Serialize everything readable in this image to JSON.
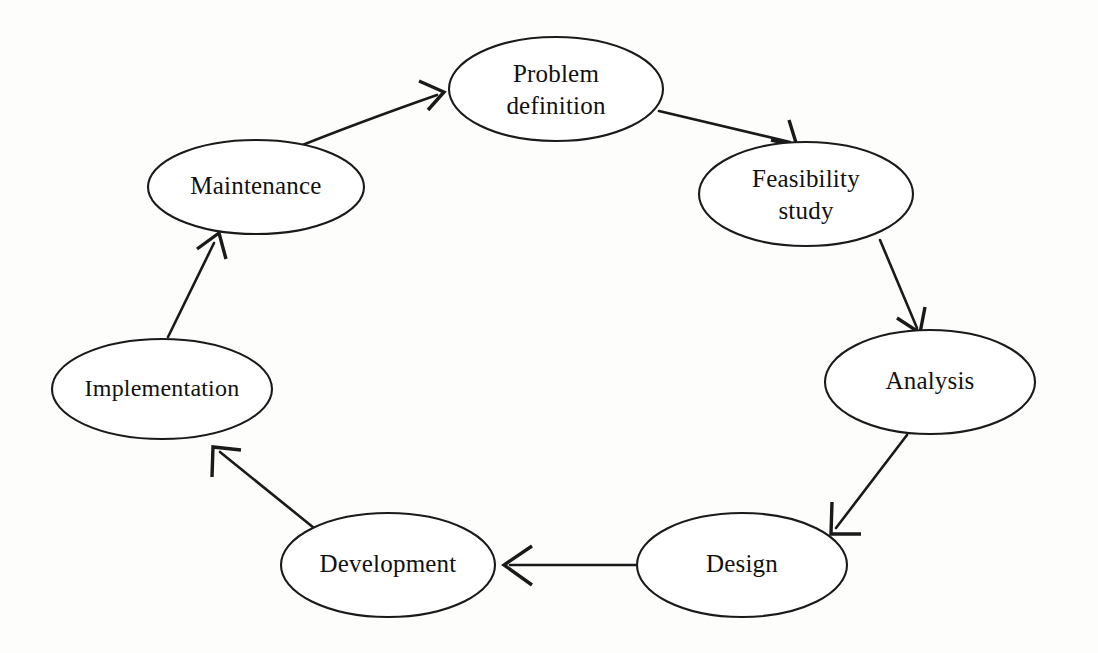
{
  "diagram": {
    "type": "cycle",
    "direction": "clockwise",
    "background_color": "#fdfdfc",
    "stroke_color": "#1a1a1a",
    "node_fill_color": "#ffffff",
    "nodes": [
      {
        "id": "problem-definition",
        "label_line1": "Problem",
        "label_line2": "definition",
        "cx": 556,
        "cy": 89,
        "rx": 107,
        "ry": 52
      },
      {
        "id": "feasibility-study",
        "label_line1": "Feasibility",
        "label_line2": "study",
        "cx": 806,
        "cy": 194,
        "rx": 107,
        "ry": 52
      },
      {
        "id": "analysis",
        "label_line1": "Analysis",
        "label_line2": "",
        "cx": 930,
        "cy": 382,
        "rx": 105,
        "ry": 52
      },
      {
        "id": "design",
        "label_line1": "Design",
        "label_line2": "",
        "cx": 742,
        "cy": 565,
        "rx": 105,
        "ry": 52
      },
      {
        "id": "development",
        "label_line1": "Development",
        "label_line2": "",
        "cx": 388,
        "cy": 565,
        "rx": 107,
        "ry": 52
      },
      {
        "id": "implementation",
        "label_line1": "Implementation",
        "label_line2": "",
        "cx": 162,
        "cy": 389,
        "rx": 110,
        "ry": 50
      },
      {
        "id": "maintenance",
        "label_line1": "Maintenance",
        "label_line2": "",
        "cx": 256,
        "cy": 187,
        "rx": 108,
        "ry": 47
      }
    ],
    "edges": [
      {
        "id": "maintenance-to-problem-definition",
        "from": "maintenance",
        "to": "problem-definition"
      },
      {
        "id": "problem-definition-to-feasibility-study",
        "from": "problem-definition",
        "to": "feasibility-study"
      },
      {
        "id": "feasibility-study-to-analysis",
        "from": "feasibility-study",
        "to": "analysis"
      },
      {
        "id": "analysis-to-design",
        "from": "analysis",
        "to": "design"
      },
      {
        "id": "design-to-development",
        "from": "design",
        "to": "development"
      },
      {
        "id": "development-to-implementation",
        "from": "development",
        "to": "implementation"
      },
      {
        "id": "implementation-to-maintenance",
        "from": "implementation",
        "to": "maintenance"
      }
    ]
  }
}
